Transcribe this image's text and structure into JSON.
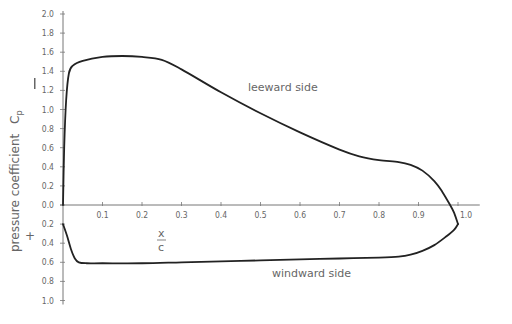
{
  "chart_data": {
    "type": "line",
    "title": "",
    "xlabel": "x/c",
    "ylabel": "pressure coefficient Cp",
    "y_sign_markers": {
      "top": "−",
      "bottom": "+"
    },
    "xlim": [
      0,
      1.05
    ],
    "ylim": [
      -1.0,
      2.0
    ],
    "y_axis_note": "suction (−Cp) plotted upward; positive pressure (+) plotted downward",
    "x_ticks": [
      0.1,
      0.2,
      0.3,
      0.4,
      0.5,
      0.6,
      0.7,
      0.8,
      0.9,
      1.0
    ],
    "x_tick_labels": [
      "0.1",
      "0.2",
      "0.3",
      "0.4",
      "0.5",
      "0.6",
      "0.7",
      "0.8",
      "0.9",
      "1.0"
    ],
    "y_ticks": [
      2.0,
      1.8,
      1.6,
      1.4,
      1.2,
      1.0,
      0.8,
      0.6,
      0.4,
      0.2,
      0.0,
      -0.2,
      -0.4,
      -0.6,
      -0.8,
      -1.0
    ],
    "y_tick_labels": [
      "2.0",
      "1.8",
      "1.6",
      "1.4",
      "1.2",
      "1.0",
      "0.8",
      "0.6",
      "0.4",
      "0.2",
      "0.0",
      "0.2",
      "0.4",
      "0.6",
      "0.8",
      "1.0"
    ],
    "grid": false,
    "legend": null,
    "series": [
      {
        "name": "leeward side",
        "x": [
          0.0,
          0.003,
          0.008,
          0.015,
          0.025,
          0.05,
          0.1,
          0.15,
          0.2,
          0.25,
          0.3,
          0.4,
          0.5,
          0.6,
          0.7,
          0.75,
          0.8,
          0.85,
          0.88,
          0.91,
          0.94,
          0.96,
          0.98,
          0.99,
          1.0
        ],
        "values": [
          0.0,
          0.6,
          1.1,
          1.38,
          1.46,
          1.51,
          1.55,
          1.56,
          1.55,
          1.52,
          1.42,
          1.18,
          0.96,
          0.76,
          0.58,
          0.51,
          0.47,
          0.45,
          0.42,
          0.36,
          0.25,
          0.14,
          0.0,
          -0.08,
          -0.2
        ]
      },
      {
        "name": "windward side",
        "x": [
          0.0,
          0.01,
          0.02,
          0.03,
          0.04,
          0.06,
          0.1,
          0.2,
          0.3,
          0.4,
          0.5,
          0.6,
          0.7,
          0.8,
          0.85,
          0.88,
          0.91,
          0.94,
          0.97,
          0.99,
          1.0
        ],
        "values": [
          -0.2,
          -0.32,
          -0.46,
          -0.56,
          -0.6,
          -0.61,
          -0.61,
          -0.61,
          -0.6,
          -0.59,
          -0.58,
          -0.57,
          -0.56,
          -0.55,
          -0.54,
          -0.52,
          -0.48,
          -0.42,
          -0.33,
          -0.26,
          -0.2
        ]
      }
    ],
    "annotations": [
      {
        "text": "leeward side",
        "x": 0.6,
        "y": 1.22
      },
      {
        "text": "windward side",
        "x": 0.6,
        "y": -0.73
      }
    ]
  },
  "labels": {
    "ylabel_text": "pressure  coefficient",
    "ylabel_symbol": "C",
    "ylabel_sub": "p",
    "minus_marker": "I",
    "plus_marker": "+",
    "x_frac_top": "x",
    "x_frac_bottom": "c",
    "leeward": "leeward  side",
    "windward": "windward  side"
  }
}
